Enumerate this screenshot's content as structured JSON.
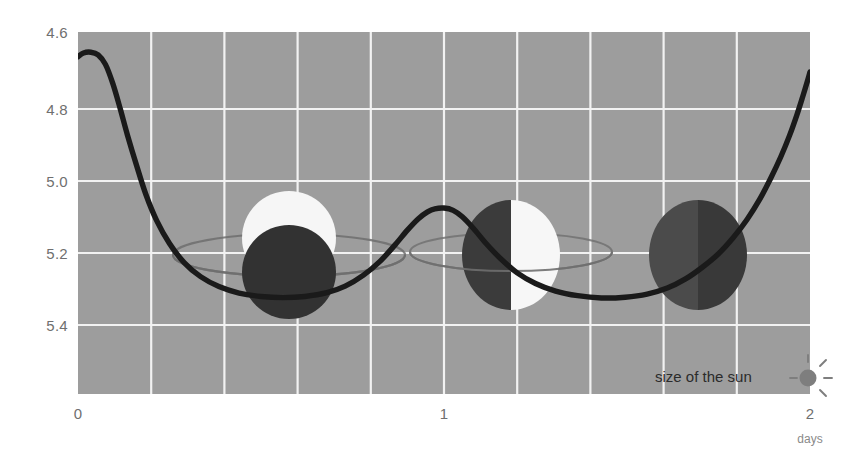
{
  "chart_data": {
    "type": "line",
    "title": "",
    "subtitle": "",
    "xlabel": "days",
    "ylabel": "",
    "xlim": [
      0,
      2
    ],
    "ylim": [
      5.5,
      4.55
    ],
    "y_inverted": true,
    "grid": true,
    "legend": null,
    "background_color": "#9d9d9d",
    "grid_color": "#f2f2f2",
    "line_color": "#1a1a1a",
    "x_ticks": [
      "0",
      "1",
      "2"
    ],
    "x_tick_values": [
      0,
      1,
      2
    ],
    "y_ticks": [
      "4.6",
      "4.8",
      "5.0",
      "5.2",
      "5.4"
    ],
    "y_tick_values": [
      4.6,
      4.8,
      5.0,
      5.2,
      5.4
    ],
    "series": [
      {
        "name": "brightness",
        "points": [
          [
            0.0,
            5.435
          ],
          [
            0.015,
            5.445
          ],
          [
            0.035,
            5.447
          ],
          [
            0.055,
            5.44
          ],
          [
            0.075,
            5.415
          ],
          [
            0.095,
            5.365
          ],
          [
            0.115,
            5.3
          ],
          [
            0.135,
            5.23
          ],
          [
            0.16,
            5.15
          ],
          [
            0.185,
            5.075
          ],
          [
            0.215,
            5.005
          ],
          [
            0.25,
            4.945
          ],
          [
            0.29,
            4.895
          ],
          [
            0.335,
            4.858
          ],
          [
            0.385,
            4.832
          ],
          [
            0.44,
            4.815
          ],
          [
            0.5,
            4.806
          ],
          [
            0.56,
            4.803
          ],
          [
            0.62,
            4.806
          ],
          [
            0.68,
            4.816
          ],
          [
            0.73,
            4.833
          ],
          [
            0.78,
            4.862
          ],
          [
            0.825,
            4.898
          ],
          [
            0.865,
            4.94
          ],
          [
            0.9,
            4.98
          ],
          [
            0.93,
            5.01
          ],
          [
            0.955,
            5.028
          ],
          [
            0.975,
            5.036
          ],
          [
            1.0,
            5.038
          ],
          [
            1.025,
            5.032
          ],
          [
            1.05,
            5.015
          ],
          [
            1.08,
            4.985
          ],
          [
            1.115,
            4.945
          ],
          [
            1.155,
            4.905
          ],
          [
            1.2,
            4.868
          ],
          [
            1.25,
            4.84
          ],
          [
            1.305,
            4.82
          ],
          [
            1.365,
            4.808
          ],
          [
            1.43,
            4.802
          ],
          [
            1.495,
            4.804
          ],
          [
            1.555,
            4.812
          ],
          [
            1.61,
            4.828
          ],
          [
            1.66,
            4.852
          ],
          [
            1.705,
            4.882
          ],
          [
            1.75,
            4.918
          ],
          [
            1.79,
            4.96
          ],
          [
            1.828,
            5.008
          ],
          [
            1.862,
            5.06
          ],
          [
            1.892,
            5.115
          ],
          [
            1.92,
            5.172
          ],
          [
            1.944,
            5.228
          ],
          [
            1.964,
            5.282
          ],
          [
            1.98,
            5.33
          ],
          [
            1.992,
            5.368
          ],
          [
            2.0,
            5.395
          ]
        ]
      }
    ],
    "annotations": [
      {
        "id": "sun-size-legend",
        "text": "size of the sun",
        "marker": "sun-icon",
        "x": 1.99,
        "y": 5.33
      }
    ],
    "illustrations": [
      {
        "id": "phase-1",
        "label": "transit-phase-planet-in-front",
        "day": 0.57,
        "star_color": "#f5f5f5",
        "planet_color": "#333333",
        "orbit_color": "#6d6d6d",
        "description": "bright star disk with dark planet disk overlapping in front, orbit ellipse"
      },
      {
        "id": "phase-2",
        "label": "quadrature-phase-side-by-side",
        "day": 1.07,
        "star_color": "#f7f7f7",
        "planet_color": "#3a3a3a",
        "orbit_color": "#6d6d6d",
        "description": "half dark half bright disk, planet beside star, orbit ellipse"
      },
      {
        "id": "phase-3",
        "label": "occultation-phase-planet-behind",
        "day": 1.62,
        "star_color": "#4d4d4d",
        "planet_color": "#3a3a3a",
        "orbit_color": "#6d6d6d",
        "description": "two dark disks overlapping, star hidden"
      }
    ]
  },
  "axes": {
    "y_labels": [
      "4.6",
      "4.8",
      "5.0",
      "5.2",
      "5.4"
    ],
    "x_labels": [
      "0",
      "1",
      "2"
    ],
    "x_unit": "days"
  },
  "legend": {
    "sun_label": "size of the sun",
    "sun_icon": "sun-icon"
  }
}
